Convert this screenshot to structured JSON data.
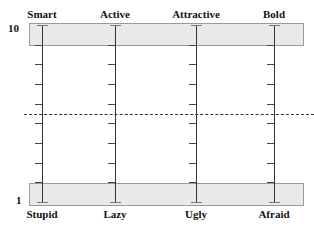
{
  "scale": {
    "max_label": "10",
    "min_label": "1",
    "tick_count": 10
  },
  "axes": [
    {
      "top": "Smart",
      "bottom": "Stupid",
      "x": 42
    },
    {
      "top": "Active",
      "bottom": "Lazy",
      "x": 115
    },
    {
      "top": "Attractive",
      "bottom": "Ugly",
      "x": 196
    },
    {
      "top": "Bold",
      "bottom": "Afraid",
      "x": 274
    }
  ],
  "midline": {
    "style": "dashed"
  }
}
